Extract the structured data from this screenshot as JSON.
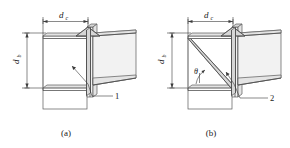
{
  "figure": {
    "background_color": "#ffffff",
    "line_color": "#4a4a4a",
    "fill_light": "#f2f2f2",
    "fill_mid": "#e4e4e4",
    "fill_dark": "#d6d6d6"
  },
  "panels": [
    {
      "id": "a",
      "caption": "(a)",
      "horizontal_dimension": {
        "symbol": "d",
        "subscript": "c"
      },
      "vertical_dimension": {
        "symbol": "d",
        "subscript": "b"
      },
      "callout": {
        "number": "1",
        "description": "vertical stiffener plate"
      },
      "angle": null
    },
    {
      "id": "b",
      "caption": "(b)",
      "horizontal_dimension": {
        "symbol": "d",
        "subscript": "c"
      },
      "vertical_dimension": {
        "symbol": "d",
        "subscript": "b"
      },
      "callout": {
        "number": "2",
        "description": "diagonal stiffener plate"
      },
      "angle": {
        "symbol": "θ",
        "description": "diagonal stiffener inclination"
      }
    }
  ]
}
